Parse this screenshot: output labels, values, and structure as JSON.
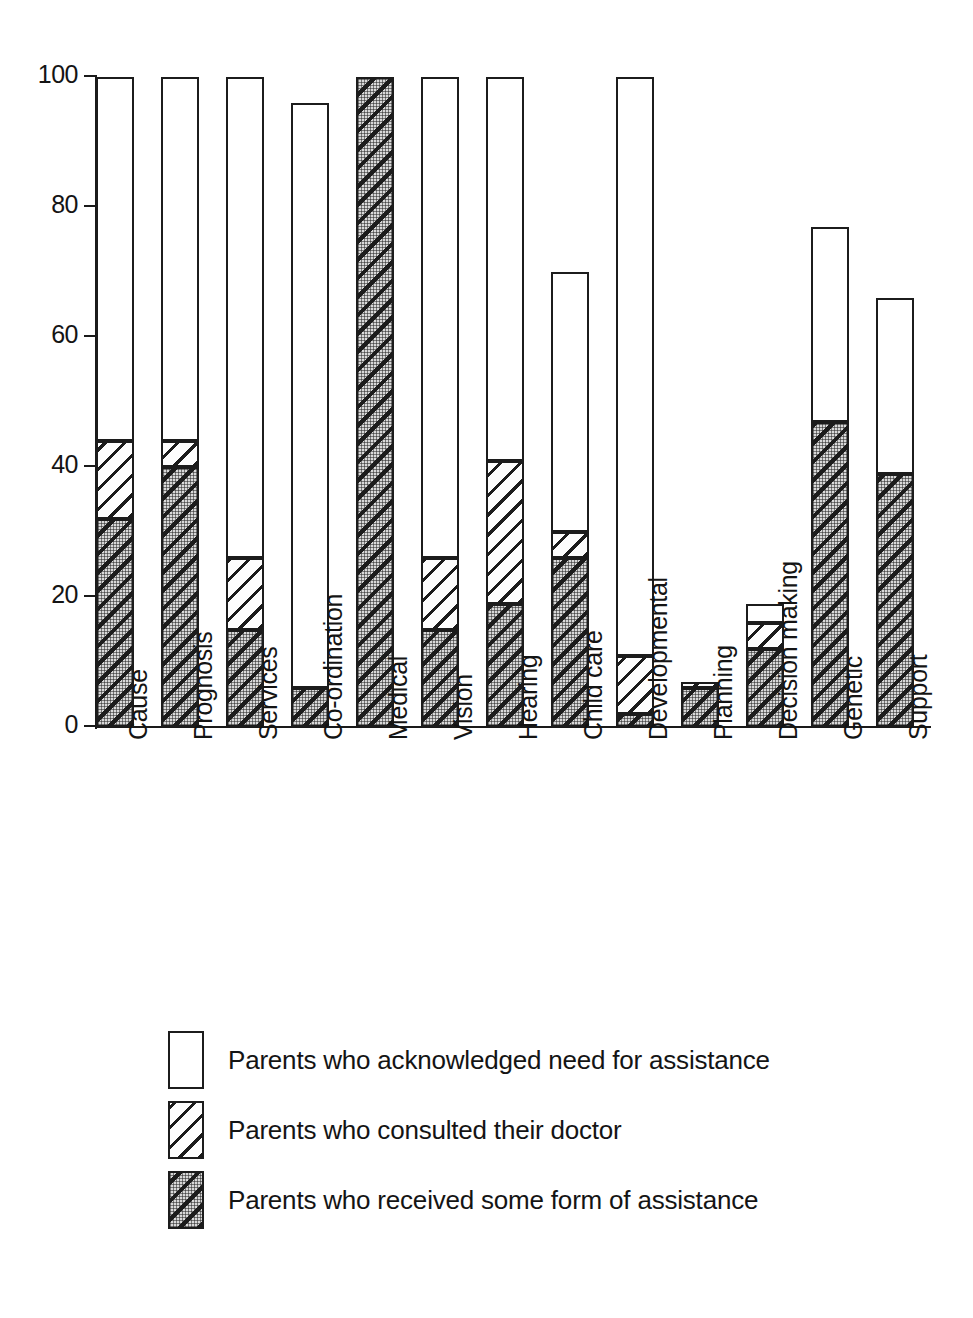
{
  "chart_data": {
    "type": "bar",
    "subtype": "stacked-bar",
    "title": "",
    "xlabel": "",
    "ylabel": "",
    "ylim": [
      0,
      100
    ],
    "yticks": [
      0,
      20,
      40,
      60,
      80,
      100
    ],
    "grid": false,
    "legend_position": "below-plot-left",
    "categories": [
      "Cause",
      "Prognosis",
      "Services",
      "Co-ordination",
      "Medical",
      "Vision",
      "Hearing",
      "Child care",
      "Developmental",
      "Planning",
      "Decision making",
      "Genetic",
      "Support"
    ],
    "series": [
      {
        "name": "Parents who acknowledged need for assistance",
        "pattern": "white",
        "cumulative_totals": [
          100,
          100,
          100,
          96,
          100,
          100,
          100,
          70,
          100,
          7,
          19,
          77,
          66
        ]
      },
      {
        "name": "Parents who consulted their doctor",
        "pattern": "diagonal-hatch",
        "cumulative_totals": [
          44,
          44,
          26,
          6,
          100,
          26,
          41,
          30,
          11,
          7,
          16,
          47,
          39
        ]
      },
      {
        "name": "Parents who received some form of assistance",
        "pattern": "dotted-diagonal-hatch",
        "cumulative_totals": [
          32,
          40,
          15,
          6,
          100,
          15,
          19,
          26,
          2,
          6,
          12,
          47,
          39
        ]
      }
    ],
    "bars": [
      {
        "category": "Cause",
        "need": 100,
        "consulted": 44,
        "received": 32
      },
      {
        "category": "Prognosis",
        "need": 100,
        "consulted": 44,
        "received": 40
      },
      {
        "category": "Services",
        "need": 100,
        "consulted": 26,
        "received": 15
      },
      {
        "category": "Co-ordination",
        "need": 96,
        "consulted": 6,
        "received": 6
      },
      {
        "category": "Medical",
        "need": 100,
        "consulted": 100,
        "received": 100
      },
      {
        "category": "Vision",
        "need": 100,
        "consulted": 26,
        "received": 15
      },
      {
        "category": "Hearing",
        "need": 100,
        "consulted": 41,
        "received": 19
      },
      {
        "category": "Child care",
        "need": 70,
        "consulted": 30,
        "received": 26
      },
      {
        "category": "Developmental",
        "need": 100,
        "consulted": 11,
        "received": 2
      },
      {
        "category": "Planning",
        "need": 7,
        "consulted": 7,
        "received": 6
      },
      {
        "category": "Decision making",
        "need": 19,
        "consulted": 16,
        "received": 12
      },
      {
        "category": "Genetic",
        "need": 77,
        "consulted": 47,
        "received": 47
      },
      {
        "category": "Support",
        "need": 66,
        "consulted": 39,
        "received": 39
      }
    ]
  },
  "axis": {
    "y_tick_labels": [
      "100",
      "80",
      "60",
      "40",
      "20",
      "0"
    ]
  },
  "legend": {
    "items": [
      {
        "label": "Parents who acknowledged need for assistance",
        "pattern": "white"
      },
      {
        "label": "Parents who consulted their doctor",
        "pattern": "diagonal-hatch"
      },
      {
        "label": "Parents who received some form of assistance",
        "pattern": "dotted-diagonal-hatch"
      }
    ]
  },
  "colors": {
    "ink": "#1c1c1c",
    "background": "#ffffff",
    "fill_light": "#ffffff",
    "fill_dotted": "#d8d8d8"
  }
}
